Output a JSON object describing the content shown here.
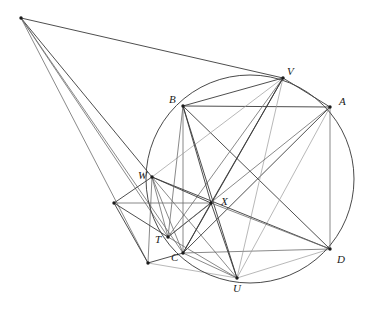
{
  "figure": {
    "kind": "euclidean-geometry-diagram",
    "canvas": {
      "width": 373,
      "height": 310,
      "background": "#ffffff"
    },
    "colors": {
      "stroke_dark": "#3a3a3a",
      "stroke_mid": "#6b6b6b",
      "stroke_light": "#9a9a9a",
      "circle": "#4a4a4a",
      "point_fill": "#1a1a1a",
      "label_text": "#1a1a1a"
    },
    "circle": {
      "cx": 250,
      "cy": 179,
      "r": 104
    },
    "points": [
      {
        "id": "P",
        "label": "",
        "x": 21,
        "y": 18,
        "lx": 0,
        "ly": 0,
        "labeled": false,
        "dot": true
      },
      {
        "id": "V",
        "label": "V",
        "x": 283,
        "y": 78,
        "lx": 287,
        "ly": 66,
        "labeled": true,
        "dot": true
      },
      {
        "id": "B",
        "label": "B",
        "x": 183,
        "y": 106,
        "lx": 169,
        "ly": 94,
        "labeled": true,
        "dot": true
      },
      {
        "id": "A",
        "label": "A",
        "x": 330,
        "y": 107,
        "lx": 339,
        "ly": 96,
        "labeled": true,
        "dot": true
      },
      {
        "id": "W",
        "label": "W",
        "x": 152,
        "y": 177,
        "lx": 138,
        "ly": 170,
        "labeled": true,
        "dot": true
      },
      {
        "id": "E",
        "label": "",
        "x": 114,
        "y": 203,
        "lx": 0,
        "ly": 0,
        "labeled": false,
        "dot": true
      },
      {
        "id": "X",
        "label": "X",
        "x": 211,
        "y": 203,
        "lx": 221,
        "ly": 196,
        "labeled": true,
        "dot": true
      },
      {
        "id": "T",
        "label": "T",
        "x": 168,
        "y": 237,
        "lx": 155,
        "ly": 234,
        "labeled": true,
        "dot": true
      },
      {
        "id": "C",
        "label": "C",
        "x": 183,
        "y": 253,
        "lx": 171,
        "ly": 252,
        "labeled": true,
        "dot": true
      },
      {
        "id": "F",
        "label": "",
        "x": 148,
        "y": 263,
        "lx": 0,
        "ly": 0,
        "labeled": false,
        "dot": true
      },
      {
        "id": "D",
        "label": "D",
        "x": 330,
        "y": 249,
        "lx": 337,
        "ly": 254,
        "labeled": true,
        "dot": true
      },
      {
        "id": "U",
        "label": "U",
        "x": 237,
        "y": 278,
        "lx": 233,
        "ly": 283,
        "labeled": true,
        "dot": true
      }
    ],
    "segments": [
      {
        "name": "apex-to-V",
        "from": "P",
        "to": "V",
        "shade": "dark"
      },
      {
        "name": "apex-to-W",
        "from": "P",
        "to": "W",
        "shade": "dark"
      },
      {
        "name": "apex-to-T",
        "from": "P",
        "to": "T",
        "shade": "mid"
      },
      {
        "name": "apex-to-C",
        "from": "P",
        "to": "C",
        "shade": "mid"
      },
      {
        "name": "apex-to-F",
        "from": "P",
        "to": "F",
        "shade": "mid"
      },
      {
        "name": "side-AB",
        "from": "A",
        "to": "B",
        "shade": "dark"
      },
      {
        "name": "side-AD",
        "from": "A",
        "to": "D",
        "shade": "mid"
      },
      {
        "name": "side-CD",
        "from": "C",
        "to": "D",
        "shade": "mid"
      },
      {
        "name": "side-BC",
        "from": "B",
        "to": "C",
        "shade": "mid"
      },
      {
        "name": "diag-AC",
        "from": "A",
        "to": "C",
        "shade": "dark"
      },
      {
        "name": "diag-BD",
        "from": "B",
        "to": "D",
        "shade": "dark"
      },
      {
        "name": "chord-BV",
        "from": "B",
        "to": "V",
        "shade": "dark"
      },
      {
        "name": "chord-AV",
        "from": "A",
        "to": "V",
        "shade": "dark"
      },
      {
        "name": "chord-VU",
        "from": "V",
        "to": "U",
        "shade": "light"
      },
      {
        "name": "chord-VC",
        "from": "V",
        "to": "C",
        "shade": "dark"
      },
      {
        "name": "chord-VT",
        "from": "V",
        "to": "T",
        "shade": "mid"
      },
      {
        "name": "chord-VW",
        "from": "V",
        "to": "W",
        "shade": "light"
      },
      {
        "name": "chord-VX",
        "from": "V",
        "to": "X",
        "shade": "dark"
      },
      {
        "name": "chord-UB",
        "from": "U",
        "to": "B",
        "shade": "dark"
      },
      {
        "name": "chord-UA",
        "from": "U",
        "to": "A",
        "shade": "light"
      },
      {
        "name": "chord-UX",
        "from": "U",
        "to": "X",
        "shade": "dark"
      },
      {
        "name": "chord-UW",
        "from": "U",
        "to": "W",
        "shade": "mid"
      },
      {
        "name": "chord-UT",
        "from": "U",
        "to": "T",
        "shade": "mid"
      },
      {
        "name": "chord-UD",
        "from": "U",
        "to": "D",
        "shade": "light"
      },
      {
        "name": "chord-UC",
        "from": "U",
        "to": "C",
        "shade": "mid"
      },
      {
        "name": "chord-UF",
        "from": "U",
        "to": "F",
        "shade": "light"
      },
      {
        "name": "seg-WX",
        "from": "W",
        "to": "X",
        "shade": "dark"
      },
      {
        "name": "seg-WT",
        "from": "W",
        "to": "T",
        "shade": "mid"
      },
      {
        "name": "seg-WC",
        "from": "W",
        "to": "C",
        "shade": "mid"
      },
      {
        "name": "seg-WE",
        "from": "W",
        "to": "E",
        "shade": "dark"
      },
      {
        "name": "seg-WF",
        "from": "W",
        "to": "F",
        "shade": "mid"
      },
      {
        "name": "seg-WD",
        "from": "W",
        "to": "D",
        "shade": "dark"
      },
      {
        "name": "seg-TX",
        "from": "T",
        "to": "X",
        "shade": "dark"
      },
      {
        "name": "seg-TE",
        "from": "T",
        "to": "E",
        "shade": "dark"
      },
      {
        "name": "seg-TA",
        "from": "T",
        "to": "A",
        "shade": "mid"
      },
      {
        "name": "seg-EF",
        "from": "E",
        "to": "F",
        "shade": "dark"
      },
      {
        "name": "seg-FC",
        "from": "F",
        "to": "C",
        "shade": "dark"
      },
      {
        "name": "seg-EX",
        "from": "E",
        "to": "X",
        "shade": "mid"
      },
      {
        "name": "seg-XD",
        "from": "X",
        "to": "D",
        "shade": "mid"
      },
      {
        "name": "seg-XC",
        "from": "X",
        "to": "C",
        "shade": "dark"
      },
      {
        "name": "seg-BX",
        "from": "B",
        "to": "X",
        "shade": "dark"
      },
      {
        "name": "seg-BT",
        "from": "B",
        "to": "T",
        "shade": "mid"
      }
    ],
    "labels": [
      {
        "id": "label-V",
        "text": "V"
      },
      {
        "id": "label-B",
        "text": "B"
      },
      {
        "id": "label-A",
        "text": "A"
      },
      {
        "id": "label-W",
        "text": "W"
      },
      {
        "id": "label-X",
        "text": "X"
      },
      {
        "id": "label-T",
        "text": "T"
      },
      {
        "id": "label-C",
        "text": "C"
      },
      {
        "id": "label-D",
        "text": "D"
      },
      {
        "id": "label-U",
        "text": "U"
      }
    ]
  }
}
